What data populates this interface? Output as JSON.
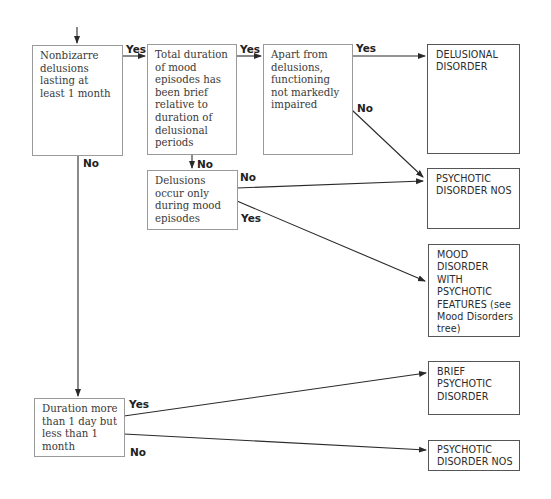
{
  "diagram": {
    "type": "decision-tree",
    "nodes": {
      "n1": {
        "text": "Nonbizarre delusions lasting at least 1 month"
      },
      "n2": {
        "text": "Total duration of mood episodes has been brief relative to duration of delusional periods"
      },
      "n3": {
        "text": "Apart from delusions, functioning not markedly impaired"
      },
      "n4": {
        "text": "DELUSIONAL DISORDER"
      },
      "n5": {
        "text": "Delusions occur only during mood episodes"
      },
      "n6": {
        "text": "PSYCHOTIC DISORDER NOS"
      },
      "n7": {
        "text": "MOOD DISORDER WITH PSYCHOTIC FEATURES (see Mood Disorders tree)"
      },
      "n8": {
        "text": "Duration more than 1 day but less than 1 month"
      },
      "n9": {
        "text": "BRIEF PSYCHOTIC DISORDER"
      },
      "n10": {
        "text": "PSYCHOTIC DISORDER NOS"
      }
    },
    "edges": [
      {
        "from": "n1",
        "to": "n2",
        "label": "Yes"
      },
      {
        "from": "n2",
        "to": "n3",
        "label": "Yes"
      },
      {
        "from": "n3",
        "to": "n4",
        "label": "Yes"
      },
      {
        "from": "n3",
        "to": "n6",
        "label": "No"
      },
      {
        "from": "n2",
        "to": "n5",
        "label": "No"
      },
      {
        "from": "n5",
        "to": "n6",
        "label": "No"
      },
      {
        "from": "n5",
        "to": "n7",
        "label": "Yes"
      },
      {
        "from": "n1",
        "to": "n8",
        "label": "No"
      },
      {
        "from": "n8",
        "to": "n9",
        "label": "Yes"
      },
      {
        "from": "n8",
        "to": "n10",
        "label": "No"
      }
    ],
    "colors": {
      "line": "#2a2a2a",
      "box_border": "#9a9a9a",
      "outcome_border": "#555555"
    }
  }
}
